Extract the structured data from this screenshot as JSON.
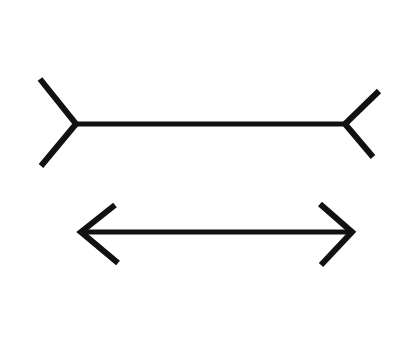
{
  "figure": {
    "name": "Muller-Lyer illusion",
    "background": "#ffffff",
    "stroke_color": "#111111",
    "stroke_width": 5,
    "shafts": [
      {
        "id": "top",
        "style": "fins-outward",
        "x1": 76,
        "y": 124,
        "x2": 345,
        "left_fin": [
          [
            40,
            79
          ],
          [
            76,
            124
          ],
          [
            41,
            166
          ]
        ],
        "right_fin": [
          [
            379,
            91
          ],
          [
            345,
            124
          ],
          [
            373,
            157
          ]
        ]
      },
      {
        "id": "bottom",
        "style": "arrowheads-inward",
        "x1": 81,
        "y": 232,
        "x2": 352,
        "left_fin": [
          [
            115,
            205
          ],
          [
            81,
            232
          ],
          [
            118,
            263
          ]
        ],
        "right_fin": [
          [
            320,
            204
          ],
          [
            352,
            232
          ],
          [
            321,
            265
          ]
        ]
      }
    ]
  }
}
